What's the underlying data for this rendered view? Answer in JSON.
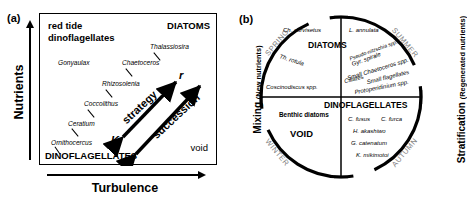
{
  "figure": {
    "panel_a": {
      "tag": "(a)",
      "y_axis_label": "Nutrients",
      "x_axis_label": "Turbulence",
      "corners": {
        "top_left_line1": "red tide",
        "top_left_line2": "dinoflagellates",
        "top_right": "DIATOMS",
        "bottom_left": "DINOFLAGELLATES",
        "bottom_right": "void"
      },
      "species": [
        {
          "name": "Gonyaulax",
          "x": 18,
          "y": 46
        },
        {
          "name": "Thalassiosira",
          "x": 110,
          "y": 30
        },
        {
          "name": "Chaetoceros",
          "x": 82,
          "y": 46
        },
        {
          "name": "Rhizosolenia",
          "x": 62,
          "y": 67
        },
        {
          "name": "Coccolithus",
          "x": 44,
          "y": 87
        },
        {
          "name": "Ceratium",
          "x": 28,
          "y": 107
        },
        {
          "name": "Ornithocercus",
          "x": 11,
          "y": 126
        }
      ],
      "arrows": [
        {
          "label": "strategy",
          "from": "K",
          "to": "r"
        },
        {
          "label": "succession",
          "from": "",
          "to": ""
        }
      ],
      "arrow_endpoints": {
        "k_label": "K",
        "r_label": "r"
      }
    },
    "panel_b": {
      "tag": "(b)",
      "left_axis_main": "Mixing",
      "left_axis_sub": "(New nutrients)",
      "right_axis_main": "Stratification",
      "right_axis_sub": "(Regenerated nutrients)",
      "seasons": [
        "SPRING",
        "SUMMER",
        "AUTUMN",
        "WINTER"
      ],
      "quadrant_groups": [
        {
          "label": "DIATOMS",
          "quadrant": "upper"
        },
        {
          "label": "DINOFLAGELLATES",
          "quadrant": "right-lower"
        },
        {
          "label": "VOID",
          "quadrant": "lower-left"
        }
      ],
      "species_upper_left": [
        "Ch. curvisetus",
        "Th. rotula",
        "Coscinodiscus spp."
      ],
      "species_upper_right": [
        "L. annulata",
        "Pseudo-nitzschia spp.",
        "Gyr. spirale",
        "Small Chaetoceros spp.",
        "Ciliates",
        "Small flagellates",
        "Protoperidinium spp."
      ],
      "species_lower_left": [
        "Benthic diatoms"
      ],
      "species_lower_right": [
        "C. fusus",
        "C. furca",
        "H. akashiwo",
        "G. catenatum",
        "K. mikimotoi"
      ]
    }
  },
  "colors": {
    "line": "#000000",
    "season_text": "#7d7d7d",
    "background": "#ffffff"
  }
}
